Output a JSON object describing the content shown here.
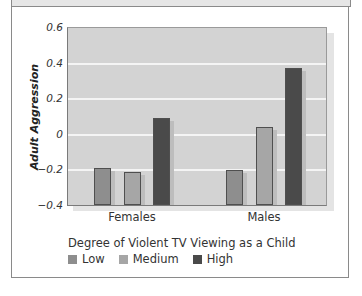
{
  "chart_data": {
    "type": "bar",
    "title": "",
    "xlabel": "",
    "ylabel": "Adult Aggression",
    "ylim": [
      -0.4,
      0.6
    ],
    "yticks": [
      "0.6",
      "0.4",
      "0.2",
      "0",
      "-0.2",
      "-0.4"
    ],
    "categories": [
      "Females",
      "Males"
    ],
    "legend_title": "Degree of Violent TV Viewing as a Child",
    "legend_position": "bottom",
    "grid": true,
    "series": [
      {
        "name": "Low",
        "color": "#8e8e8e",
        "values": [
          -0.19,
          -0.2
        ]
      },
      {
        "name": "Medium",
        "color": "#a6a6a6",
        "values": [
          -0.21,
          0.04
        ]
      },
      {
        "name": "High",
        "color": "#4a4a4a",
        "values": [
          0.09,
          0.37
        ]
      }
    ]
  },
  "axis": {
    "ylabel": "Adult Aggression",
    "ticks": [
      "0.6",
      "0.4",
      "0.2",
      "0",
      "−0.2",
      "−0.4"
    ]
  },
  "categories": {
    "females": "Females",
    "males": "Males"
  },
  "legend": {
    "title": "Degree of Violent TV Viewing as a Child",
    "items": [
      {
        "label": "Low",
        "color": "#8e8e8e"
      },
      {
        "label": "Medium",
        "color": "#a6a6a6"
      },
      {
        "label": "High",
        "color": "#4a4a4a"
      }
    ]
  }
}
